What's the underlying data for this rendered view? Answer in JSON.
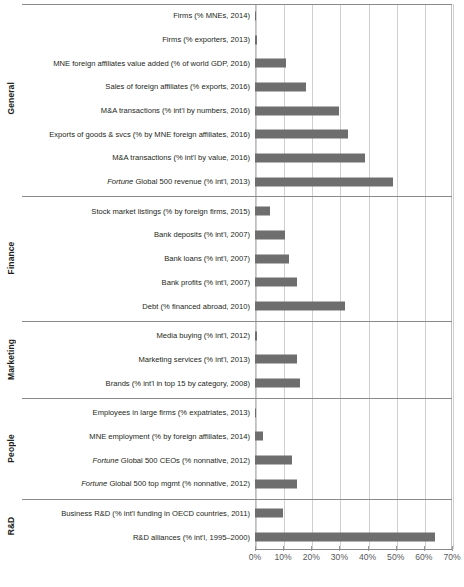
{
  "chart_data": {
    "type": "bar",
    "orientation": "horizontal",
    "title": "",
    "xlabel": "",
    "ylabel": "",
    "xlim": [
      0,
      70
    ],
    "xunit": "%",
    "grid": true,
    "legend": "none",
    "bar_color": "#6e6e6e",
    "xticks": [
      {
        "value": 0,
        "label": "0%"
      },
      {
        "value": 10,
        "label": "10%"
      },
      {
        "value": 20,
        "label": "20%"
      },
      {
        "value": 30,
        "label": "30%"
      },
      {
        "value": 40,
        "label": "40%"
      },
      {
        "value": 50,
        "label": "50%"
      },
      {
        "value": 60,
        "label": "60%"
      },
      {
        "value": 70,
        "label": "70%"
      }
    ],
    "groups": [
      {
        "name": "General",
        "items": [
          {
            "label": "Firms (% MNEs, 2014)",
            "label_italic_prefix": "",
            "value": 0.2
          },
          {
            "label": "Firms (% exporters, 2013)",
            "label_italic_prefix": "",
            "value": 0.8
          },
          {
            "label": "MNE foreign affiliates value added (% of world GDP, 2016)",
            "label_italic_prefix": "",
            "value": 11
          },
          {
            "label": "Sales of foreign affiliates (% exports, 2016)",
            "label_italic_prefix": "",
            "value": 18
          },
          {
            "label": "M&A transactions (% int'l by numbers, 2016)",
            "label_italic_prefix": "",
            "value": 30
          },
          {
            "label": "Exports of goods & svcs (% by MNE foreign affiliates, 2016)",
            "label_italic_prefix": "",
            "value": 33
          },
          {
            "label": "M&A transactions (% int'l by value, 2016)",
            "label_italic_prefix": "",
            "value": 39
          },
          {
            "label": " Global 500 revenue (% int'l, 2013)",
            "label_italic_prefix": "Fortune",
            "value": 49
          }
        ]
      },
      {
        "name": "Finance",
        "items": [
          {
            "label": "Stock market listings (% by foreign firms, 2015)",
            "label_italic_prefix": "",
            "value": 5.5
          },
          {
            "label": "Bank deposits (% int'l, 2007)",
            "label_italic_prefix": "",
            "value": 10.5
          },
          {
            "label": "Bank loans (% int'l, 2007)",
            "label_italic_prefix": "",
            "value": 12
          },
          {
            "label": "Bank profits (% int'l, 2007)",
            "label_italic_prefix": "",
            "value": 15
          },
          {
            "label": "Debt (% financed abroad, 2010)",
            "label_italic_prefix": "",
            "value": 32
          }
        ]
      },
      {
        "name": "Marketing",
        "items": [
          {
            "label": "Media buying (% int'l, 2012)",
            "label_italic_prefix": "",
            "value": 0.7
          },
          {
            "label": "Marketing services (% int'l, 2013)",
            "label_italic_prefix": "",
            "value": 15
          },
          {
            "label": "Brands (% int'l in top 15 by category, 2008)",
            "label_italic_prefix": "",
            "value": 16
          }
        ]
      },
      {
        "name": "People",
        "items": [
          {
            "label": "Employees in large firms (% expatriates, 2013)",
            "label_italic_prefix": "",
            "value": 0.15
          },
          {
            "label": "MNE employment (% by foreign affiliates, 2014)",
            "label_italic_prefix": "",
            "value": 3
          },
          {
            "label": " Global 500 CEOs (% nonnative, 2012)",
            "label_italic_prefix": "Fortune",
            "value": 13
          },
          {
            "label": " Global 500 top mgmt (% nonnative, 2012)",
            "label_italic_prefix": "Fortune",
            "value": 15
          }
        ]
      },
      {
        "name": "R&D",
        "items": [
          {
            "label": "Business R&D (% int'l funding in OECD countries, 2011)",
            "label_italic_prefix": "",
            "value": 10
          },
          {
            "label": "R&D alliances (% int'l, 1995–2000)",
            "label_italic_prefix": "",
            "value": 64
          }
        ]
      }
    ]
  }
}
